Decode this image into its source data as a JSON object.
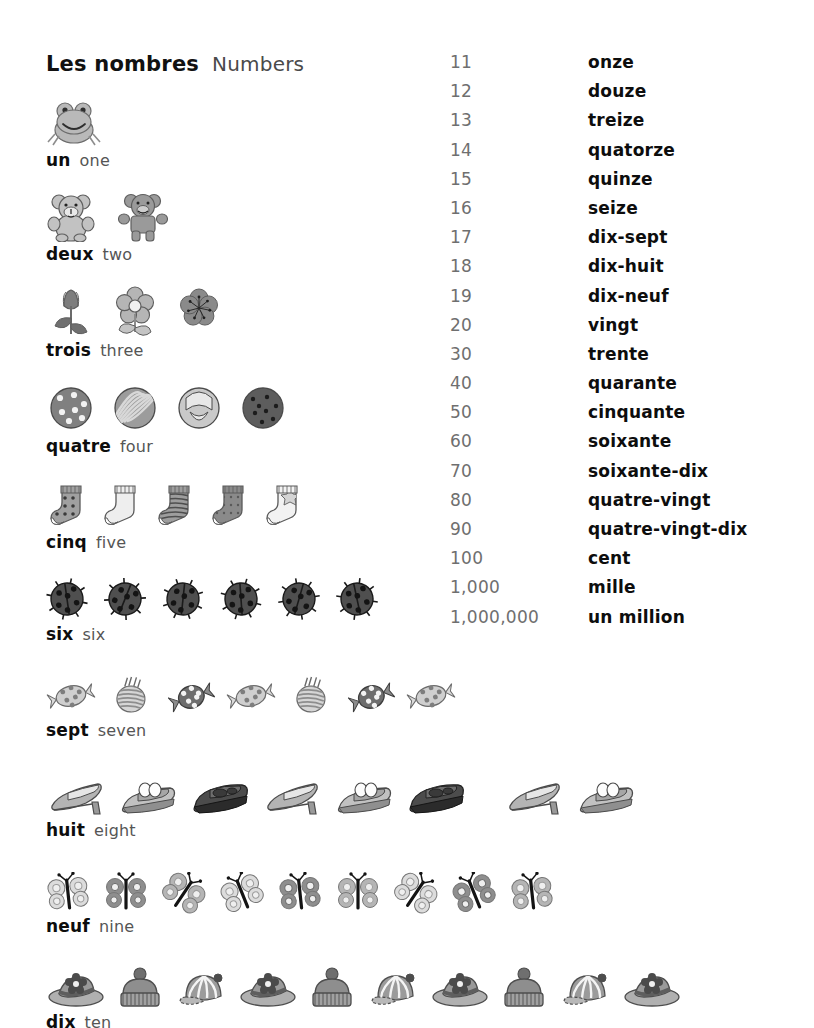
{
  "header": {
    "title_fr": "Les nombres",
    "title_en": "Numbers"
  },
  "counting": {
    "groups": [
      {
        "fr": "un",
        "en": "one",
        "count": 1,
        "icon": "frog-icon",
        "icon_label": "frog"
      },
      {
        "fr": "deux",
        "en": "two",
        "count": 2,
        "icon": "teddy-bear-icon",
        "icon_label": "teddy bear"
      },
      {
        "fr": "trois",
        "en": "three",
        "count": 3,
        "icon": "flower-icon",
        "icon_label": "flower"
      },
      {
        "fr": "quatre",
        "en": "four",
        "count": 4,
        "icon": "cookie-icon",
        "icon_label": "cookie"
      },
      {
        "fr": "cinq",
        "en": "five",
        "count": 5,
        "icon": "sock-icon",
        "icon_label": "sock"
      },
      {
        "fr": "six",
        "en": "six",
        "count": 6,
        "icon": "ladybug-icon",
        "icon_label": "ladybug"
      },
      {
        "fr": "sept",
        "en": "seven",
        "count": 7,
        "icon": "candy-icon",
        "icon_label": "candy"
      },
      {
        "fr": "huit",
        "en": "eight",
        "count": 8,
        "icon": "shoe-icon",
        "icon_label": "shoe"
      },
      {
        "fr": "neuf",
        "en": "nine",
        "count": 9,
        "icon": "butterfly-icon",
        "icon_label": "butterfly"
      },
      {
        "fr": "dix",
        "en": "ten",
        "count": 10,
        "icon": "hat-icon",
        "icon_label": "hat"
      }
    ]
  },
  "numbers": {
    "rows": [
      {
        "value": "11",
        "word": "onze"
      },
      {
        "value": "12",
        "word": "douze"
      },
      {
        "value": "13",
        "word": "treize"
      },
      {
        "value": "14",
        "word": "quatorze"
      },
      {
        "value": "15",
        "word": "quinze"
      },
      {
        "value": "16",
        "word": "seize"
      },
      {
        "value": "17",
        "word": "dix-sept"
      },
      {
        "value": "18",
        "word": "dix-huit"
      },
      {
        "value": "19",
        "word": "dix-neuf"
      },
      {
        "value": "20",
        "word": "vingt"
      },
      {
        "value": "30",
        "word": "trente"
      },
      {
        "value": "40",
        "word": "quarante"
      },
      {
        "value": "50",
        "word": "cinquante"
      },
      {
        "value": "60",
        "word": "soixante"
      },
      {
        "value": "70",
        "word": "soixante-dix"
      },
      {
        "value": "80",
        "word": "quatre-vingt"
      },
      {
        "value": "90",
        "word": "quatre-vingt-dix"
      },
      {
        "value": "100",
        "word": "cent"
      },
      {
        "value": "1,000",
        "word": "mille"
      },
      {
        "value": "1,000,000",
        "word": "un million"
      }
    ]
  },
  "colors": {
    "ink": "#0d0d0d",
    "muted": "#555555",
    "numeral": "#6f6f6f",
    "paper": "#ffffff",
    "art_dark": "#3f3f3f",
    "art_mid": "#8d8d8d",
    "art_light": "#cfcfcf"
  }
}
